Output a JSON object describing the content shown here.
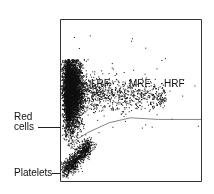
{
  "chart_data": {
    "type": "scatter",
    "title": "",
    "xlabel": "",
    "ylabel": "",
    "grid": false,
    "legend": null,
    "regions": [
      {
        "label": "LRF",
        "x": 0.35
      },
      {
        "label": "MRF",
        "x": 0.62
      },
      {
        "label": "HRF",
        "x": 0.85
      }
    ],
    "annotations": [
      {
        "label": "Red cells",
        "target": "dense cluster left-middle"
      },
      {
        "label": "Platelets",
        "target": "elongated cluster bottom-left"
      }
    ],
    "clusters": [
      {
        "name": "Red cells",
        "center": [
          0.08,
          0.56
        ],
        "spread": [
          0.05,
          0.13
        ],
        "density": "very high"
      },
      {
        "name": "Reticulocytes",
        "center": [
          0.45,
          0.53
        ],
        "spread": [
          0.3,
          0.06
        ],
        "density": "low"
      },
      {
        "name": "Platelets",
        "center": [
          0.12,
          0.14
        ],
        "spread": [
          0.1,
          0.05
        ],
        "density": "high"
      }
    ],
    "threshold_curve": [
      [
        0.05,
        0.22
      ],
      [
        0.2,
        0.3
      ],
      [
        0.35,
        0.36
      ],
      [
        0.5,
        0.39
      ],
      [
        0.7,
        0.38
      ],
      [
        1.0,
        0.38
      ]
    ]
  },
  "labels": {
    "lrf": "LRF",
    "mrf": "MRF",
    "hrf": "HRF",
    "red_cells_line1": "Red",
    "red_cells_line2": "cells",
    "platelets": "Platelets"
  }
}
